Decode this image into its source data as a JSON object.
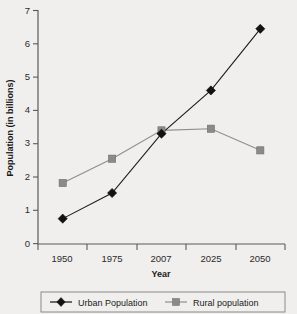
{
  "chart_data": {
    "type": "line",
    "title": "",
    "xlabel": "Year",
    "ylabel": "Population (in billions)",
    "categories": [
      "1950",
      "1975",
      "2007",
      "2025",
      "2050"
    ],
    "xtick_labels": [
      "1950",
      "1975",
      "2007",
      "2025",
      "2050"
    ],
    "ytick_labels": [
      "0",
      "1",
      "2",
      "3",
      "4",
      "5",
      "6",
      "7"
    ],
    "ylim": [
      0,
      7
    ],
    "ytick_step": 1,
    "grid": false,
    "legend_position": "bottom",
    "series": [
      {
        "name": "Urban Population",
        "marker": "diamond",
        "color": "#121212",
        "values": [
          0.75,
          1.52,
          3.3,
          4.6,
          6.45
        ]
      },
      {
        "name": "Rural population",
        "marker": "square",
        "color": "#8a8a8a",
        "values": [
          1.82,
          2.55,
          3.4,
          3.45,
          2.8
        ]
      }
    ]
  },
  "legend": {
    "entries": [
      {
        "label": "Urban Population"
      },
      {
        "label": "Rural population"
      }
    ]
  },
  "colors": {
    "background": "#f0efed",
    "axis": "#5a5a5a",
    "urban": "#121212",
    "rural": "#8a8a8a",
    "text": "#1a1a1a"
  }
}
